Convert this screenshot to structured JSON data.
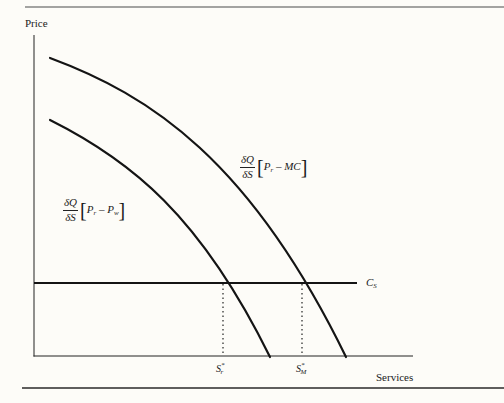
{
  "figure": {
    "axes": {
      "y_label": "Price",
      "x_label": "Services"
    },
    "curves": {
      "outer": {
        "name": "marginal benefit with MC",
        "numerator": "δQ",
        "denominator": "δS",
        "expr_left": "P",
        "expr_left_sub": "r",
        "expr_op": " – ",
        "expr_right": "MC",
        "expr_right_sub": ""
      },
      "inner": {
        "name": "marginal benefit with wholesale price",
        "numerator": "δQ",
        "denominator": "δS",
        "expr_left": "P",
        "expr_left_sub": "r",
        "expr_op": " – ",
        "expr_right": "P",
        "expr_right_sub": "w"
      }
    },
    "cost_line": {
      "label_main": "C",
      "label_sub": "S"
    },
    "x_markers": [
      {
        "main": "S",
        "sup": "*",
        "sub": "r"
      },
      {
        "main": "S",
        "sup": "*",
        "sub": "M"
      }
    ],
    "colors": {
      "line": "#141414",
      "rule": "#3a3a3a",
      "background": "#fdfcf8"
    }
  }
}
